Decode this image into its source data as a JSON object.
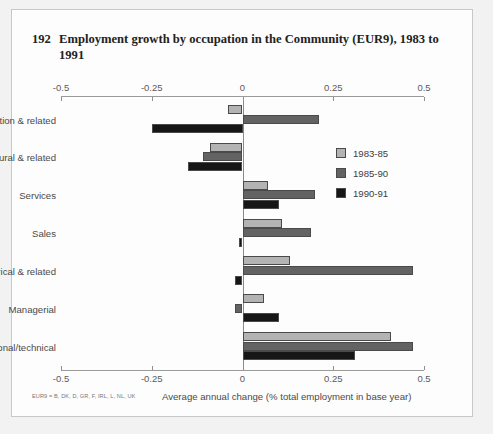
{
  "figure": {
    "number": "192",
    "title": "Employment growth by occupation in the Community (EUR9), 1983 to 1991",
    "xaxis_title": "Average annual change (% total employment in base year)",
    "footnote": "EUR9 = B, DK, D, GR, F, IRL, L, NL, UK"
  },
  "colors": {
    "series_1983_85": "#b3b3b3",
    "series_1985_90": "#636363",
    "series_1990_91": "#161616",
    "bar_outline": "#4a4a4a",
    "panel_background": "#fdfdfd",
    "page_background": "#f2f2f2",
    "axis": "#8f8f8f"
  },
  "legend": {
    "position": "right-upper",
    "entries": [
      {
        "label": "1983-85",
        "color": "#b3b3b3"
      },
      {
        "label": "1985-90",
        "color": "#636363"
      },
      {
        "label": "1990-91",
        "color": "#161616"
      }
    ]
  },
  "chart_data": {
    "type": "bar",
    "orientation": "horizontal",
    "title": "Employment growth by occupation in the Community (EUR9), 1983 to 1991",
    "xlabel": "Average annual change (% total employment in base year)",
    "ylabel": "",
    "xlim": [
      -0.5,
      0.5
    ],
    "xticks": [
      -0.5,
      -0.25,
      0,
      0.25,
      0.5
    ],
    "xtick_labels": [
      "-0.5",
      "-0.25",
      "0",
      "0.25",
      "0.5"
    ],
    "axis_top": true,
    "axis_bottom": true,
    "grid": false,
    "zero_line": true,
    "categories": [
      "Production & related",
      "Agricultural & related",
      "Services",
      "Sales",
      "Clerical & related",
      "Managerial",
      "Professional/technical"
    ],
    "series": [
      {
        "name": "1983-85",
        "color": "#b3b3b3",
        "values": [
          -0.04,
          -0.09,
          0.07,
          0.11,
          0.13,
          0.06,
          0.41
        ]
      },
      {
        "name": "1985-90",
        "color": "#636363",
        "values": [
          0.21,
          -0.11,
          0.2,
          0.19,
          0.47,
          -0.02,
          0.47
        ]
      },
      {
        "name": "1990-91",
        "color": "#161616",
        "values": [
          -0.25,
          -0.15,
          0.1,
          -0.01,
          -0.02,
          0.1,
          0.31
        ]
      }
    ]
  }
}
